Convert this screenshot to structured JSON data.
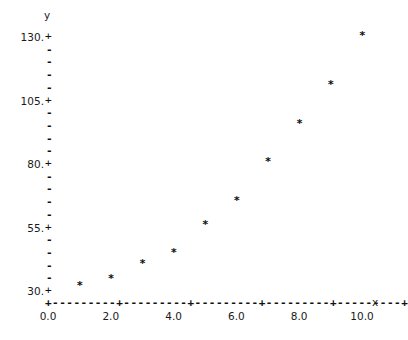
{
  "chart_data": {
    "type": "scatter",
    "title": "",
    "xlabel": "x",
    "ylabel": "y",
    "x": [
      1,
      2,
      3,
      4,
      5,
      6,
      7,
      8,
      9,
      10
    ],
    "values": [
      31.6,
      34.3,
      40.2,
      44.6,
      55.6,
      65.0,
      80.4,
      95.3,
      110.6,
      130.0
    ],
    "series": [
      {
        "name": "data",
        "marker": "*",
        "values": [
          31.6,
          34.3,
          40.2,
          44.6,
          55.6,
          65.0,
          80.4,
          95.3,
          110.6,
          130.0
        ]
      }
    ],
    "xlim": [
      0.0,
      10.0
    ],
    "ylim": [
      30,
      130
    ],
    "x_tick_labels": [
      "0.0",
      "2.0",
      "4.0",
      "6.0",
      "8.0",
      "10.0"
    ],
    "x_tick_values": [
      0.0,
      2.0,
      4.0,
      6.0,
      8.0,
      10.0
    ],
    "y_tick_labels": [
      "130.",
      "105.",
      "80.",
      "55.",
      "30."
    ],
    "y_tick_values": [
      130,
      105,
      80,
      55,
      30
    ],
    "y_minor_per_interval": 4,
    "grid": false,
    "legend": null,
    "axis_style": "ascii-dashed"
  },
  "axis": {
    "y_name": "y",
    "x_name": "x",
    "major_tick_glyph": "+",
    "minor_tick_glyph": "-",
    "point_glyph": "*",
    "x_axis_segment": "+---------"
  },
  "caption": {
    "text": ""
  },
  "colors": {
    "ink": "#111111",
    "background": "#ffffff",
    "caption": "#d2d2d2"
  }
}
